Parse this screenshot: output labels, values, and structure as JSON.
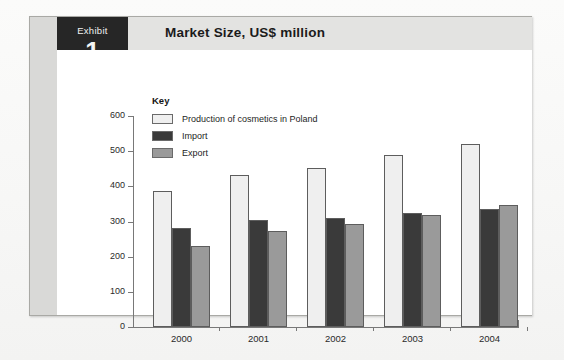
{
  "exhibit": {
    "word": "Exhibit",
    "number": "1",
    "title": "Market Size, US$ million"
  },
  "legend": {
    "title": "Key",
    "items": [
      {
        "label": "Production of cosmetics in Poland",
        "color": "#efefef"
      },
      {
        "label": "Import",
        "color": "#3a3a3a"
      },
      {
        "label": "Export",
        "color": "#9a9a9a"
      }
    ]
  },
  "axis": {
    "y_ticks": [
      "0",
      "100",
      "200",
      "300",
      "400",
      "500",
      "600"
    ],
    "x_ticks": [
      "2000",
      "2001",
      "2002",
      "2003",
      "2004"
    ]
  },
  "chart_data": {
    "type": "bar",
    "title": "Market Size, US$ million",
    "xlabel": "",
    "ylabel": "",
    "ylim": [
      0,
      600
    ],
    "ytick_step": 100,
    "grid": false,
    "legend_position": "top-left-inside",
    "categories": [
      "2000",
      "2001",
      "2002",
      "2003",
      "2004"
    ],
    "series": [
      {
        "name": "Production of cosmetics in Poland",
        "color": "#efefef",
        "values": [
          388,
          432,
          451,
          490,
          520
        ]
      },
      {
        "name": "Import",
        "color": "#3a3a3a",
        "values": [
          282,
          303,
          311,
          324,
          336
        ]
      },
      {
        "name": "Export",
        "color": "#9a9a9a",
        "values": [
          230,
          273,
          293,
          319,
          348
        ]
      }
    ]
  }
}
